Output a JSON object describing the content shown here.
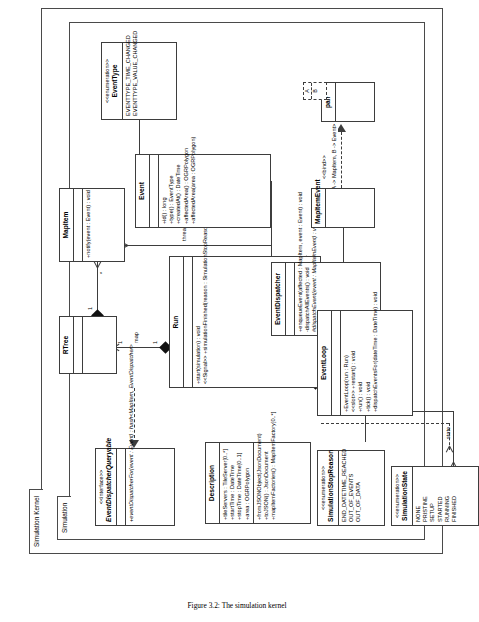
{
  "figure": {
    "caption": "Figure 3.2: The simulation kernel"
  },
  "packages": {
    "outer": {
      "label": "Simulation Kernel"
    },
    "inner": {
      "label": "Simulation"
    }
  },
  "classes": {
    "event_dispatcher_queryable": {
      "stereotype": "<<interface>>",
      "name": "EventDispatcherQueryable",
      "members": [
        "+eventDispatcherFor(event : Event) : hash<MapItem, EventDispatcher>"
      ]
    },
    "run": {
      "stereotype": "",
      "name": "Run",
      "members": [
        "+start(simulation) : void",
        "<<Signal>> +simulationFinished(reason : SimulationStopReason)"
      ]
    },
    "rtree": {
      "stereotype": "",
      "name": "RTree",
      "members": []
    },
    "mapitem": {
      "stereotype": "",
      "name": "MapItem",
      "members": [
        "+notify(event : Event) : void"
      ]
    },
    "event": {
      "stereotype": "",
      "name": "Event",
      "members": [
        "+id() : long",
        "+type() : EventType",
        "+createdAt() : DateTime",
        "+affectedArea() : OGRPolygon",
        "+affectedArea(area : OGRPolygon)"
      ]
    },
    "event_type": {
      "stereotype": "<<enumeration>>",
      "name": "EventType",
      "members": [
        "EVENTTYPE_TIME_CHANGED",
        "EVENTTYPE_VALUE_CHANGED"
      ]
    },
    "simulation_state": {
      "stereotype": "<<enumeration>>",
      "name": "SimulationState",
      "members": [
        "NONE",
        "PRISTINE",
        "SETUP",
        "STARTED",
        "RUNNING",
        "FINISHED"
      ]
    },
    "simulation_stop_reason": {
      "stereotype": "<<enumeration>>",
      "name": "SimulationStopReason",
      "members": [
        "END_DATETIME_REACHED",
        "OUT_OF_EVENTS",
        "OUT_OF_DATA"
      ]
    },
    "description": {
      "stereotype": "",
      "name": "Description",
      "members": [
        "+tileServers : TileServer[0..*]",
        "+startTime : DateTime",
        "+stopTime : DateTime[0..1]",
        "+area : OGRPolygon",
        "+fromJSONObject(JsonDocument)",
        "+toJSON() : JsonDocument",
        "+mapItemFactories() : MapItemFactory[0..*]"
      ]
    },
    "event_loop": {
      "stereotype": "",
      "name": "EventLoop",
      "members": [
        "+EventLoop(run : Run)",
        "<<slot>> +restart() : void",
        "+run() : void",
        "+tick() : void",
        "+dispatchEventsFor(dateTime : DateTime) : void"
      ]
    },
    "event_dispatcher": {
      "stereotype": "",
      "name": "EventDispatcher",
      "members": [
        "+enqueueEvent(affected : MapItem, event : Event) : void",
        "-dispatchAllEvents() : void",
        "#dispatchEvent(event : MapItemEvent) : void"
      ]
    },
    "mapitem_event": {
      "stereotype": "",
      "name": "MapItemEvent",
      "members": []
    },
    "pair": {
      "stereotype": "",
      "name": "pair",
      "members": [],
      "template_params": [
        "A",
        "B"
      ],
      "bind_stereotype": "<<bind>>",
      "bind_text": "<A -> MapItem, B -> Event>"
    }
  },
  "relations": {
    "map_label": "map",
    "state_label": "state",
    "run_label": "run",
    "event_dispatcher_label": "eventDispatcher",
    "thread_local_mapitems_label": "threadLocalMapItems",
    "mult_one_a": "1",
    "mult_one_b": "1",
    "mult_one_c": "1",
    "mult_one_d": "1",
    "mult_star_a": "*",
    "mult_star_b": "*"
  }
}
